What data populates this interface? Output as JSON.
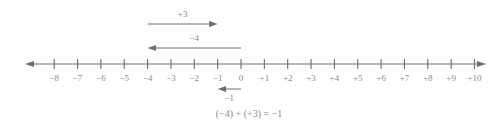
{
  "figure": {
    "kind": "number-line-addition-diagram",
    "axis": {
      "min": -8,
      "max": 10,
      "y": 64,
      "x_start": 25,
      "x_end": 486,
      "zero_x": 241,
      "unit_px": 23.35,
      "tick_half_height": 5,
      "line_color": "#6e6e6e",
      "label_color": "#8b8b8b"
    },
    "tick_labels": [
      "−8",
      "−7",
      "−6",
      "−5",
      "−4",
      "−3",
      "−2",
      "−1",
      "0",
      "+1",
      "+2",
      "+3",
      "+4",
      "+5",
      "+6",
      "+7",
      "+8",
      "+9",
      "+10"
    ],
    "tick_values": [
      -8,
      -7,
      -6,
      -5,
      -4,
      -3,
      -2,
      -1,
      0,
      1,
      2,
      3,
      4,
      5,
      6,
      7,
      8,
      9,
      10
    ],
    "vectors": [
      {
        "id": "vector-plus-3",
        "label": "+3",
        "from": -4,
        "to": -1,
        "direction": "right",
        "row_y": 24,
        "label_y": 9,
        "label_at": -2.5
      },
      {
        "id": "vector-minus-4",
        "label": "−4",
        "from": 0,
        "to": -4,
        "direction": "left",
        "row_y": 48,
        "label_y": 33,
        "label_at": -2.0
      },
      {
        "id": "vector-minus-1",
        "label": "−1",
        "from": 0,
        "to": -1,
        "direction": "left",
        "row_y": 89,
        "label_y": 93,
        "label_at": -0.5
      }
    ],
    "equation": "(−4) + (+3) = −1"
  },
  "chart_data": {
    "type": "number-line",
    "title": "",
    "xlabel": "",
    "ylabel": "",
    "xlim": [
      -8,
      10
    ],
    "grid": false,
    "legend": "none",
    "tick_values": [
      -8,
      -7,
      -6,
      -5,
      -4,
      -3,
      -2,
      -1,
      0,
      1,
      2,
      3,
      4,
      5,
      6,
      7,
      8,
      9,
      10
    ],
    "tick_labels": [
      "−8",
      "−7",
      "−6",
      "−5",
      "−4",
      "−3",
      "−2",
      "−1",
      "0",
      "+1",
      "+2",
      "+3",
      "+4",
      "+5",
      "+6",
      "+7",
      "+8",
      "+9",
      "+10"
    ],
    "annotations": [
      {
        "label": "+3",
        "start": -4,
        "end": -1,
        "value": 3,
        "position": "above",
        "arrow": "right"
      },
      {
        "label": "−4",
        "start": 0,
        "end": -4,
        "value": -4,
        "position": "above",
        "arrow": "left"
      },
      {
        "label": "−1",
        "start": 0,
        "end": -1,
        "value": -1,
        "position": "below",
        "arrow": "left"
      }
    ],
    "equation": "(−4) + (+3) = −1"
  }
}
